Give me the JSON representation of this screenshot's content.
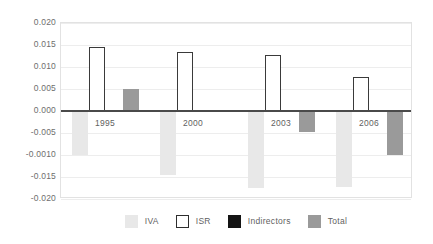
{
  "chart_data": {
    "type": "bar",
    "title": "",
    "subtitle": "",
    "xlabel": "",
    "ylabel": "",
    "categories": [
      "1995",
      "2000",
      "2003",
      "2006"
    ],
    "ylim": [
      -0.02,
      0.02
    ],
    "ytick_labels": [
      "0.020",
      "0.015",
      "0.010",
      "0.005",
      "0.000",
      "-0.005",
      "-0.0010",
      "-0.015",
      "-0.020"
    ],
    "ytick_values": [
      0.02,
      0.015,
      0.01,
      0.005,
      0.0,
      -0.005,
      -0.01,
      -0.015,
      -0.02
    ],
    "grid": true,
    "legend_position": "bottom",
    "series": [
      {
        "name": "IVA",
        "color": "#e8e8e8",
        "values": [
          -0.01,
          -0.0145,
          -0.0175,
          -0.0172
        ]
      },
      {
        "name": "ISR",
        "color": "#ffffff",
        "border_color": "#3a3a3a",
        "values": [
          0.0145,
          0.0133,
          0.0128,
          0.0078
        ]
      },
      {
        "name": "Indirectors",
        "color": "#141414",
        "values": [
          0.0003,
          0.0003,
          0.0,
          0.0
        ]
      },
      {
        "name": "Total",
        "color": "#9a9a9a",
        "values": [
          0.005,
          -0.0002,
          -0.0047,
          -0.01
        ]
      }
    ]
  },
  "legend": {
    "items": [
      {
        "label": "IVA",
        "swatch": "iva-swatch"
      },
      {
        "label": "ISR",
        "swatch": "isr-swatch"
      },
      {
        "label": "Indirectors",
        "swatch": "indirectors-swatch"
      },
      {
        "label": "Total",
        "swatch": "total-swatch"
      }
    ]
  },
  "axis": {
    "zero_line_color": "#4a4a4a",
    "grid_color": "#ededed",
    "tick_text_color": "#6e6e6e"
  }
}
